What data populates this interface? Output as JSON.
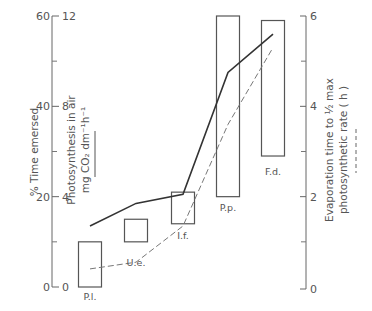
{
  "chart_data": {
    "type": "bar",
    "subtype": "floating-range-bars-with-lines",
    "title": "",
    "categories": [
      "P.l.",
      "U.e.",
      "I.f.",
      "P.p.",
      "F.d."
    ],
    "axes": {
      "left_outer": {
        "label": "% Time emersed",
        "range": [
          0,
          60
        ],
        "ticks": [
          0,
          20,
          40,
          60
        ],
        "minor_ticks": [
          10,
          30,
          50
        ]
      },
      "left_inner": {
        "label_line1": "Photosynthesis in air",
        "label_line2": "mg CO₂ dm⁻¹h⁻¹",
        "legend_style": "solid",
        "range": [
          0,
          12
        ],
        "ticks": [
          0,
          4,
          8,
          12
        ]
      },
      "right": {
        "label_line1": "Evaporation time to ½ max",
        "label_line2": "photosynthetic rate ( h )",
        "legend_style": "dashed",
        "range": [
          0,
          6
        ],
        "ticks": [
          0,
          2,
          4,
          6
        ],
        "minor_ticks": [
          1,
          3,
          5
        ]
      }
    },
    "series": [
      {
        "name": "% Time emersed (range)",
        "kind": "floating-bar",
        "axis": "left_outer",
        "ranges": [
          [
            0,
            10
          ],
          [
            10,
            15
          ],
          [
            14,
            21
          ],
          [
            20,
            60
          ],
          [
            29,
            59
          ]
        ]
      },
      {
        "name": "Photosynthesis in air (mg CO2 dm-1 h-1)",
        "kind": "line",
        "style": "solid",
        "axis": "left_inner",
        "values": [
          2.7,
          3.7,
          4.1,
          9.5,
          11.2
        ]
      },
      {
        "name": "Evaporation time to 1/2 max photosynthetic rate (h)",
        "kind": "line",
        "style": "dashed",
        "axis": "right",
        "values": [
          0.4,
          0.55,
          1.35,
          3.6,
          5.3
        ]
      }
    ],
    "grid": false,
    "legend": "none (line style indicated under axis titles)"
  }
}
